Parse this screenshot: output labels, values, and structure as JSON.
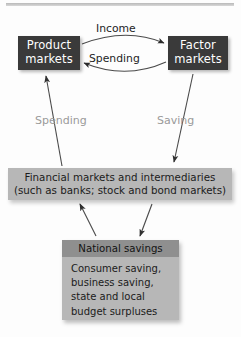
{
  "diagram": {
    "top_rule": true,
    "nodes": {
      "product_markets": {
        "line1": "Product",
        "line2": "markets",
        "fill": "#3a3a3a",
        "text_color": "#ffffff"
      },
      "factor_markets": {
        "line1": "Factor",
        "line2": "markets",
        "fill": "#3a3a3a",
        "text_color": "#ffffff"
      },
      "financial_markets": {
        "line1": "Financial markets and intermediaries",
        "line2": "(such as banks; stock and bond markets)",
        "fill": "#b7b7b7",
        "text_color": "#1b1b1b"
      },
      "national_savings": {
        "header": "National savings",
        "header_fill": "#8f8f8f",
        "body_fill": "#b7b7b7",
        "body_line1": "Consumer saving,",
        "body_line2": "business saving,",
        "body_line3": "state and local",
        "body_line4": "budget surpluses"
      }
    },
    "labels": {
      "income": "Income",
      "spending_top": "Spending",
      "spending_mid": "Spending",
      "saving_mid": "Saving",
      "dark_label_color": "#1d1d1d",
      "gray_label_color": "#9a9a9a"
    },
    "arrows": [
      {
        "name": "income-arc",
        "from": "product_markets",
        "to": "factor_markets",
        "label": "Income",
        "style": "curved"
      },
      {
        "name": "spending-arc",
        "from": "factor_markets",
        "to": "product_markets",
        "label": "Spending",
        "style": "curved"
      },
      {
        "name": "spending-up-arrow",
        "from": "financial_markets",
        "to": "product_markets",
        "label": "Spending",
        "style": "straight"
      },
      {
        "name": "saving-down-arrow",
        "from": "factor_markets",
        "to": "financial_markets",
        "label": "Saving",
        "style": "straight"
      },
      {
        "name": "national-savings-to-financial-arrow",
        "from": "national_savings",
        "to": "financial_markets",
        "label": "",
        "style": "straight"
      },
      {
        "name": "financial-to-national-savings-arrow",
        "from": "financial_markets",
        "to": "national_savings",
        "label": "",
        "style": "straight"
      }
    ]
  }
}
